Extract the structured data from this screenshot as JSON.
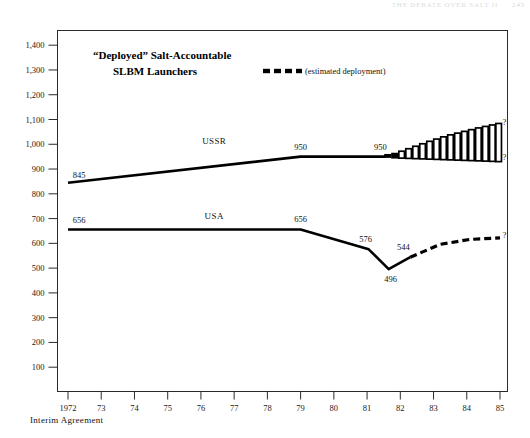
{
  "page_header": {
    "running_head": "THE DEBATE OVER SALT II",
    "page_number": "245"
  },
  "chart_data": {
    "type": "line",
    "title": "“Deployed” Salt-Accountable",
    "title_line2": "SLBM Launchers",
    "subtitle": "",
    "xlabel": "",
    "ylabel": "",
    "xlim": [
      1972,
      1985
    ],
    "ylim": [
      0,
      1450
    ],
    "yticks": [
      100,
      200,
      300,
      400,
      500,
      600,
      700,
      800,
      900,
      1000,
      1100,
      1200,
      1300,
      1400
    ],
    "ytick_labels": [
      "100",
      "200",
      "300",
      "400",
      "500",
      "600",
      "700",
      "800",
      "900",
      "1,000",
      "1,100",
      "1,200",
      "1,300",
      "1,400"
    ],
    "xticks": [
      1972,
      1973,
      1974,
      1975,
      1976,
      1977,
      1978,
      1979,
      1980,
      1981,
      1982,
      1983,
      1984,
      1985
    ],
    "xtick_labels": [
      "1972",
      "73",
      "74",
      "75",
      "76",
      "77",
      "78",
      "79",
      "80",
      "81",
      "82",
      "83",
      "84",
      "85"
    ],
    "grid": false,
    "legend_position": "top-center",
    "legend": [
      {
        "label": "(estimated deployment)",
        "style": "dashed"
      }
    ],
    "series": [
      {
        "name": "USSR",
        "style": "solid",
        "label_x": 1976.4,
        "label_y": 1000,
        "x": [
          1972,
          1979,
          1981.55
        ],
        "values": [
          845,
          950,
          950
        ],
        "point_labels": [
          {
            "x": 1972,
            "y": 845,
            "text": "845"
          },
          {
            "x": 1979,
            "y": 950,
            "text": "950"
          },
          {
            "x": 1981.55,
            "y": 950,
            "text": "950"
          }
        ]
      },
      {
        "name": "USA",
        "style": "solid",
        "label_x": 1976.4,
        "label_y": 700,
        "x": [
          1972,
          1979,
          1981.05,
          1981.65,
          1982.3
        ],
        "values": [
          656,
          656,
          576,
          496,
          544
        ],
        "point_labels": [
          {
            "x": 1972,
            "y": 656,
            "text": "656"
          },
          {
            "x": 1979,
            "y": 656,
            "text": "656"
          },
          {
            "x": 1981.05,
            "y": 576,
            "text": "576"
          },
          {
            "x": 1981.65,
            "y": 496,
            "text": "496"
          },
          {
            "x": 1982.3,
            "y": 544,
            "text": "544"
          }
        ]
      },
      {
        "name": "USA estimated",
        "style": "dashed",
        "x": [
          1982.3,
          1983.2,
          1984.1,
          1985
        ],
        "values": [
          544,
          596,
          616,
          622
        ],
        "point_labels": []
      }
    ],
    "uncertainty_band": {
      "name": "USSR estimated range",
      "style": "vertical-bars",
      "x_start": 1981.55,
      "x_end": 1985,
      "bars": [
        {
          "x": 1981.62,
          "low": 948,
          "high": 958
        },
        {
          "x": 1981.83,
          "low": 945,
          "high": 963
        },
        {
          "x": 1982.04,
          "low": 944,
          "high": 972
        },
        {
          "x": 1982.25,
          "low": 943,
          "high": 982
        },
        {
          "x": 1982.46,
          "low": 942,
          "high": 992
        },
        {
          "x": 1982.67,
          "low": 941,
          "high": 1002
        },
        {
          "x": 1982.88,
          "low": 940,
          "high": 1012
        },
        {
          "x": 1983.09,
          "low": 939,
          "high": 1021
        },
        {
          "x": 1983.3,
          "low": 938,
          "high": 1030
        },
        {
          "x": 1983.51,
          "low": 937,
          "high": 1038
        },
        {
          "x": 1983.72,
          "low": 936,
          "high": 1045
        },
        {
          "x": 1983.93,
          "low": 935,
          "high": 1052
        },
        {
          "x": 1984.14,
          "low": 934,
          "high": 1059
        },
        {
          "x": 1984.35,
          "low": 933,
          "high": 1066
        },
        {
          "x": 1984.56,
          "low": 932,
          "high": 1072
        },
        {
          "x": 1984.77,
          "low": 931,
          "high": 1078
        },
        {
          "x": 1984.96,
          "low": 930,
          "high": 1084
        }
      ]
    },
    "annotations": [
      {
        "name": "ussr-upper-question",
        "x": 1985,
        "y": 1090,
        "text": "?"
      },
      {
        "name": "ussr-lower-question",
        "x": 1985,
        "y": 948,
        "text": "?"
      },
      {
        "name": "usa-question",
        "x": 1985,
        "y": 634,
        "text": "?"
      }
    ]
  },
  "footnote": {
    "text": "Interim Agreement"
  }
}
